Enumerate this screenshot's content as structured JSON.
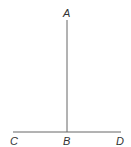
{
  "diagram": {
    "type": "geometry",
    "points": [
      {
        "label": "A",
        "x": 67,
        "y": 20
      },
      {
        "label": "B",
        "x": 67,
        "y": 132
      },
      {
        "label": "C",
        "x": 13,
        "y": 132
      },
      {
        "label": "D",
        "x": 121,
        "y": 132
      }
    ],
    "segments": [
      {
        "from": "A",
        "to": "B"
      },
      {
        "from": "C",
        "to": "D"
      }
    ],
    "labels": {
      "a": "A",
      "b": "B",
      "c": "C",
      "d": "D"
    },
    "line_color": "#555555",
    "label_color": "#333333"
  }
}
